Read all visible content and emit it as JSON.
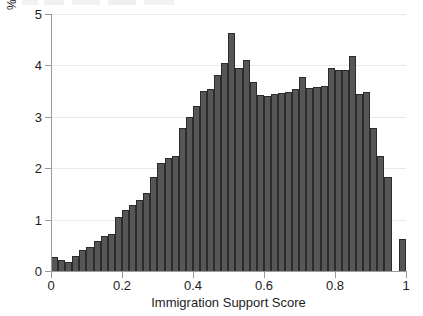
{
  "chart_data": {
    "type": "bar",
    "title": "",
    "subtitle": "",
    "xlabel": "Immigration Support Score",
    "ylabel": "%",
    "xlim": [
      0,
      1
    ],
    "ylim": [
      0,
      5
    ],
    "grid": true,
    "legend": null,
    "bin_width": 0.02,
    "bar_color": "#565656",
    "bar_edge_color": "#2c2c2c",
    "xticks": [
      0,
      0.2,
      0.4,
      0.6,
      0.8,
      1
    ],
    "xtick_labels": [
      "0",
      "0.2",
      "0.4",
      "0.6",
      "0.8",
      "1"
    ],
    "yticks": [
      0,
      1,
      2,
      3,
      4,
      5
    ],
    "ytick_labels": [
      "0",
      "1",
      "2",
      "3",
      "4",
      "5"
    ],
    "categories": [
      "0.00",
      "0.02",
      "0.04",
      "0.06",
      "0.08",
      "0.10",
      "0.12",
      "0.14",
      "0.16",
      "0.18",
      "0.20",
      "0.22",
      "0.24",
      "0.26",
      "0.28",
      "0.30",
      "0.32",
      "0.34",
      "0.36",
      "0.38",
      "0.40",
      "0.42",
      "0.44",
      "0.46",
      "0.48",
      "0.50",
      "0.52",
      "0.54",
      "0.56",
      "0.58",
      "0.60",
      "0.62",
      "0.64",
      "0.66",
      "0.68",
      "0.70",
      "0.72",
      "0.74",
      "0.76",
      "0.78",
      "0.80",
      "0.82",
      "0.84",
      "0.86",
      "0.88",
      "0.90",
      "0.92",
      "0.94",
      "0.96",
      "0.98"
    ],
    "values": [
      0.28,
      0.22,
      0.18,
      0.3,
      0.4,
      0.47,
      0.58,
      0.69,
      0.72,
      1.05,
      1.18,
      1.29,
      1.38,
      1.52,
      1.82,
      2.1,
      2.2,
      2.24,
      2.78,
      3.0,
      3.22,
      3.5,
      3.55,
      3.82,
      4.05,
      4.63,
      3.95,
      4.1,
      3.68,
      3.42,
      3.4,
      3.44,
      3.46,
      3.48,
      3.55,
      3.78,
      3.57,
      3.58,
      3.6,
      3.95,
      3.92,
      3.92,
      4.18,
      3.44,
      3.48,
      2.78,
      2.24,
      1.82,
      0.0,
      0.63
    ]
  },
  "axes": {
    "y_title": "%",
    "x_title": "Immigration Support Score"
  }
}
